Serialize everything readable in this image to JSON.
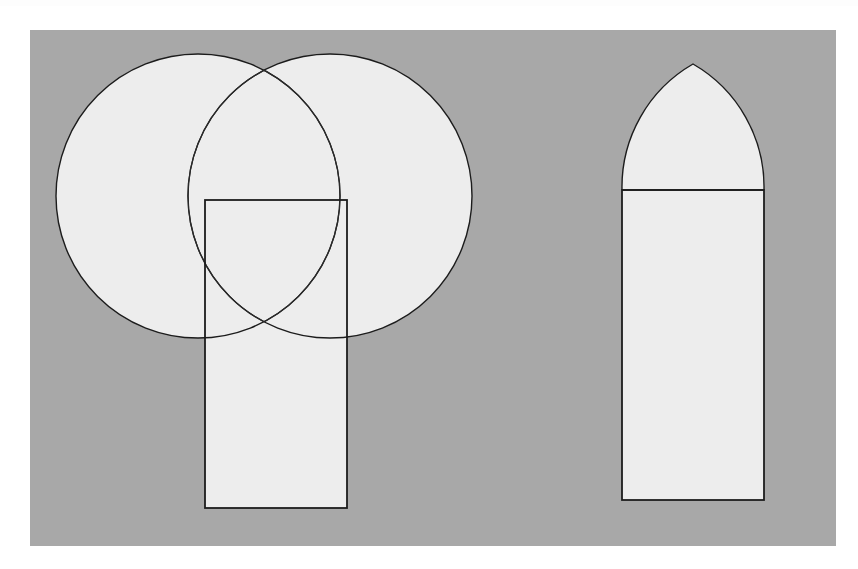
{
  "page": {
    "width": 858,
    "height": 569,
    "background_color": "#ffffff"
  },
  "plate": {
    "name": "figure-plate",
    "x": 30,
    "y": 30,
    "width": 806,
    "height": 516,
    "background_color": "#a8a8a8"
  },
  "style": {
    "shape_fill_color": "#ededed",
    "stroke_color": "#1c1c1c",
    "stroke_width": 1.4,
    "rect_stroke_width": 1.8
  },
  "chart_data": {
    "type": "diagram",
    "subtitle": "Left: construction with two intersecting circles. Right: resulting arch outline.",
    "xlabel": "",
    "ylabel": "",
    "grid": false,
    "legend": "none",
    "figures": [
      {
        "id": "construction-figure",
        "label": "Construction figure (left)",
        "elements": [
          {
            "name": "left-circle",
            "type": "circle",
            "cx": 198,
            "cy": 196,
            "r": 142,
            "filled": true
          },
          {
            "name": "right-circle",
            "type": "circle",
            "cx": 330,
            "cy": 196,
            "r": 142,
            "filled": true
          },
          {
            "name": "construction-rectangle",
            "type": "rectangle",
            "x": 205,
            "y": 200,
            "width": 142,
            "height": 308,
            "filled": true
          },
          {
            "name": "vesica-overlap",
            "type": "lens",
            "note": "Intersection region of the two circles, apex near (264,60) and lower cusp near (264,332)"
          }
        ]
      },
      {
        "id": "arch-figure",
        "label": "Arch figure (right)",
        "elements": [
          {
            "name": "arch-head",
            "type": "pointed-arch",
            "apex_x": 693,
            "apex_y": 64,
            "springing_y": 190,
            "left_x": 622,
            "right_x": 764,
            "radius": 142,
            "filled": true
          },
          {
            "name": "arch-body-rectangle",
            "type": "rectangle",
            "x": 622,
            "y": 190,
            "width": 142,
            "height": 310,
            "filled": true
          },
          {
            "name": "springing-line",
            "type": "line",
            "x1": 622,
            "y1": 190,
            "x2": 764,
            "y2": 190
          }
        ]
      }
    ]
  }
}
